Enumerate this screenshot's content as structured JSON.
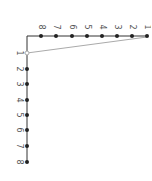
{
  "diagram": {
    "type": "ladder-graph",
    "colors": {
      "edge": "#333333",
      "node": "#222222",
      "connector": "#aaaaaa",
      "label": "#555555"
    },
    "top_row": {
      "nodes": [
        {
          "label": "8",
          "x": 41
        },
        {
          "label": "7",
          "x": 56
        },
        {
          "label": "6",
          "x": 72
        },
        {
          "label": "5",
          "x": 87
        },
        {
          "label": "4",
          "x": 102
        },
        {
          "label": "3",
          "x": 117
        },
        {
          "label": "2",
          "x": 132
        },
        {
          "label": "1",
          "x": 147
        }
      ],
      "y": 36
    },
    "left_column": {
      "nodes": [
        {
          "label": "1",
          "y": 53,
          "hollow": true
        },
        {
          "label": "2",
          "y": 69
        },
        {
          "label": "3",
          "y": 84
        },
        {
          "label": "4",
          "y": 100
        },
        {
          "label": "5",
          "y": 115
        },
        {
          "label": "6",
          "y": 130
        },
        {
          "label": "7",
          "y": 146
        },
        {
          "label": "8",
          "y": 162
        }
      ],
      "x": 27
    },
    "connector": {
      "from": "top-1",
      "to": "left-1"
    }
  }
}
